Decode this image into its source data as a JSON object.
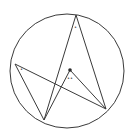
{
  "diagram": {
    "type": "circle-inscribed-angles",
    "stroke_color": "#3a3a3a",
    "circle": {
      "cx": 67,
      "cy": 71,
      "r": 57
    },
    "center_point": {
      "x": 70,
      "y": 70,
      "r": 1.8
    },
    "points": {
      "T": {
        "x": 76,
        "y": 15
      },
      "L": {
        "x": 15,
        "y": 64
      },
      "B": {
        "x": 44,
        "y": 120
      },
      "R": {
        "x": 106,
        "y": 109
      }
    },
    "segments": [
      {
        "name": "segment-l-r",
        "from": "L",
        "to": "R"
      },
      {
        "name": "segment-l-b",
        "from": "L",
        "to": "B"
      },
      {
        "name": "segment-b-t",
        "from": "B",
        "to": "T"
      },
      {
        "name": "segment-t-r",
        "from": "T",
        "to": "R"
      },
      {
        "name": "segment-b-o",
        "from": "B",
        "to": "O"
      },
      {
        "name": "segment-o-r",
        "from": "O",
        "to": "R"
      }
    ],
    "angle_marks": [
      {
        "name": "angle-mark-top",
        "label": "•",
        "x": 75.5,
        "y": 29
      },
      {
        "name": "angle-mark-left",
        "label": "•",
        "x": 21.5,
        "y": 71
      },
      {
        "name": "angle-mark-center",
        "label": "••",
        "x": 70,
        "y": 80
      }
    ]
  }
}
